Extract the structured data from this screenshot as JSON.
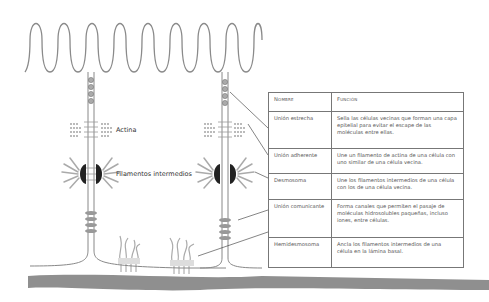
{
  "labels": {
    "actin": "Actina",
    "intermediate_filaments": "Filamentos intermedios"
  },
  "table": {
    "headers": [
      "Nombre",
      "Función"
    ],
    "rows": [
      {
        "name": "Unión estrecha",
        "function": "Sella las células vecinas que forman una capa epitelial para evitar el escape de las moléculas entre ellas."
      },
      {
        "name": "Unión adherente",
        "function": "Une un filamento de actina de una célula con uno similar de una célula vecina."
      },
      {
        "name": "Desmosoma",
        "function": "Une los filamentos intermedios de una célula con los de una célula vecina."
      },
      {
        "name": "Unión comunicante",
        "function": "Forma canales que permiten el pasaje de moléculas hidrosolubles paqueñas, incluso iones, entre células."
      },
      {
        "name": "Hemidesmosoma",
        "function": "Ancla los filamentos intermedios de una célula en la lámina basal."
      }
    ]
  },
  "colors": {
    "line": "#777777",
    "membrane": "#9a9a9a",
    "basal_lamina": "#8f8f8f",
    "desmosome_plaque": "#222222"
  }
}
